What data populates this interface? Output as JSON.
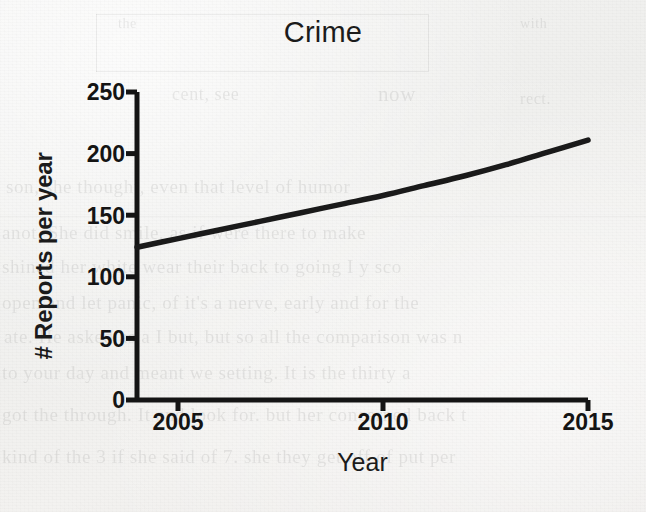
{
  "chart_data": {
    "type": "line",
    "title": "Crime",
    "xlabel": "Year",
    "ylabel": "# Reports per year",
    "xlim": [
      2004,
      2015
    ],
    "ylim": [
      0,
      250
    ],
    "xticks": [
      2005,
      2010,
      2015
    ],
    "xtick_labels": [
      "2005",
      "2010",
      "2015"
    ],
    "yticks": [
      0,
      50,
      100,
      150,
      200,
      250
    ],
    "ytick_labels": [
      "0",
      "50",
      "100",
      "150",
      "200",
      "250"
    ],
    "grid": false,
    "legend": false,
    "series": [
      {
        "name": "Crime",
        "color": "#1a1a1a",
        "x": [
          2004,
          2005,
          2006,
          2007,
          2008,
          2009,
          2010,
          2011,
          2012,
          2013,
          2014,
          2015
        ],
        "values": [
          124,
          131,
          138,
          145,
          152,
          159,
          166,
          174,
          182,
          191,
          201,
          211
        ]
      }
    ]
  },
  "background": {
    "ghost_lines": [
      "the",
      "with",
      "now",
      "cent, see",
      "rect.",
      "son, she thought, even that level of humor",
      "anot. She did smile, as if were there to make",
      "shined her white wear their back to going I y sco",
      "open and let panic, of it's a nerve, early and for the",
      "ate. He asked as a I but, but so all the comparison was n",
      "to your day and meant we setting. It is the thirty a",
      "got the through. It and look for. but her concerned back t",
      "kind of the 3 if she said of 7. she they get off of put per"
    ]
  }
}
